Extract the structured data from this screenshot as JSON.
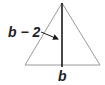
{
  "figure": {
    "type": "isosceles-triangle-with-altitude",
    "height_label": "b − 2",
    "base_label": "b",
    "colors": {
      "triangle_outline": "#9a9a9a",
      "altitude": "#1a1a1a",
      "text": "#222222",
      "background": "#ffffff"
    }
  }
}
